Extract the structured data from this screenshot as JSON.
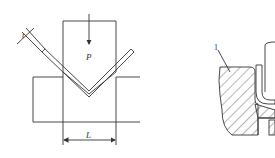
{
  "figure": {
    "left_panel": {
      "title": "V-bending schematic",
      "force_label": "P",
      "span_label": "L",
      "thickness_label": "t"
    },
    "right_panel": {
      "title": "Die cross-section",
      "part_label": "1"
    },
    "colors": {
      "line": "#333333",
      "background": "#ffffff"
    }
  }
}
